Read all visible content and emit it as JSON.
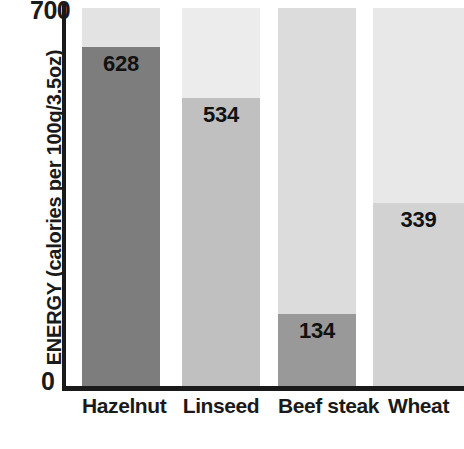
{
  "chart_data": {
    "type": "bar",
    "title": "",
    "subtitle": "",
    "xlabel": "",
    "ylabel": "ENERGY (calories per 100g/3.5oz)",
    "categories": [
      "Hazelnut",
      "Linseed",
      "Beef steak",
      "Wheat"
    ],
    "values": [
      628,
      534,
      134,
      339
    ],
    "value_labels": [
      "628",
      "534",
      "134",
      "339"
    ],
    "ylim": [
      0,
      700
    ],
    "yticks": [
      0,
      700
    ],
    "ytick_labels": [
      "0",
      "700"
    ],
    "grid": false,
    "legend": false,
    "legend_position": "none",
    "bar_style": "filled-track",
    "track_max": 700,
    "series": [
      {
        "name": "Energy",
        "values": [
          628,
          534,
          134,
          339
        ]
      }
    ],
    "bars": [
      {
        "category": "Hazelnut",
        "value": 628,
        "label": "628",
        "fill_color": "#7d7d7d",
        "track_color": "#e3e3e3"
      },
      {
        "category": "Linseed",
        "value": 534,
        "label": "534",
        "fill_color": "#c0c0c0",
        "track_color": "#ececec"
      },
      {
        "category": "Beef steak",
        "value": 134,
        "label": "134",
        "fill_color": "#999999",
        "track_color": "#dcdcdc"
      },
      {
        "category": "Wheat",
        "value": 339,
        "label": "339",
        "fill_color": "#d2d2d2",
        "track_color": "#e8e8e8"
      }
    ],
    "axis_color": "#1a1a1a",
    "text_color": "#1a1a1a",
    "background_color": "#ffffff"
  },
  "axis": {
    "y_top_label": "700",
    "y_bottom_label": "0",
    "y_title": "ENERGY (calories per 100g/3.5oz)"
  }
}
